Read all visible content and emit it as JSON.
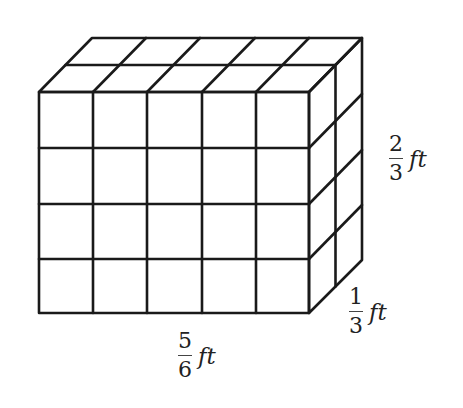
{
  "diagram": {
    "type": "rectangular-prism-unit-cubes",
    "grid": {
      "columns": 5,
      "rows": 4,
      "depth": 2
    },
    "line_color": "#1a1a1a",
    "background": "#ffffff"
  },
  "labels": {
    "length": {
      "numerator": "5",
      "denominator": "6",
      "unit": "ft"
    },
    "height": {
      "numerator": "2",
      "denominator": "3",
      "unit": "ft"
    },
    "depth": {
      "numerator": "1",
      "denominator": "3",
      "unit": "ft"
    }
  }
}
